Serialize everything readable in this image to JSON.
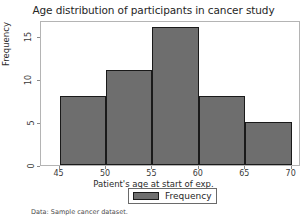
{
  "chart_data": {
    "type": "bar",
    "title": "Age distribution of participants in cancer study",
    "xlabel": "Patient's age at start of exp.",
    "ylabel": "Frequency",
    "categories": [
      "45-50",
      "50-55",
      "55-60",
      "60-65",
      "65-70"
    ],
    "bin_edges": [
      45,
      50,
      55,
      60,
      65,
      70
    ],
    "values": [
      8,
      11,
      16,
      8,
      5
    ],
    "series": [
      {
        "name": "Frequency",
        "values": [
          8,
          11,
          16,
          8,
          5
        ]
      }
    ],
    "xlim": [
      43,
      71
    ],
    "ylim": [
      0,
      16.8
    ],
    "xticks": [
      45,
      50,
      55,
      60,
      65,
      70
    ],
    "xtick_labels": [
      "45",
      "50",
      "55",
      "60",
      "65",
      "70"
    ],
    "yticks": [
      0,
      5,
      10,
      15
    ],
    "ytick_labels": [
      "0",
      "5",
      "10",
      "15"
    ],
    "grid": false,
    "legend_position": "below-axis-center",
    "bar_color": "#6e6e6e",
    "bar_edge_color": "#1a1a1a",
    "frame_color": "#b4b4b4"
  },
  "legend": {
    "entries": [
      {
        "label": "Frequency",
        "color": "#6e6e6e"
      }
    ]
  },
  "footnote": {
    "text": "Data: Sample cancer dataset."
  }
}
